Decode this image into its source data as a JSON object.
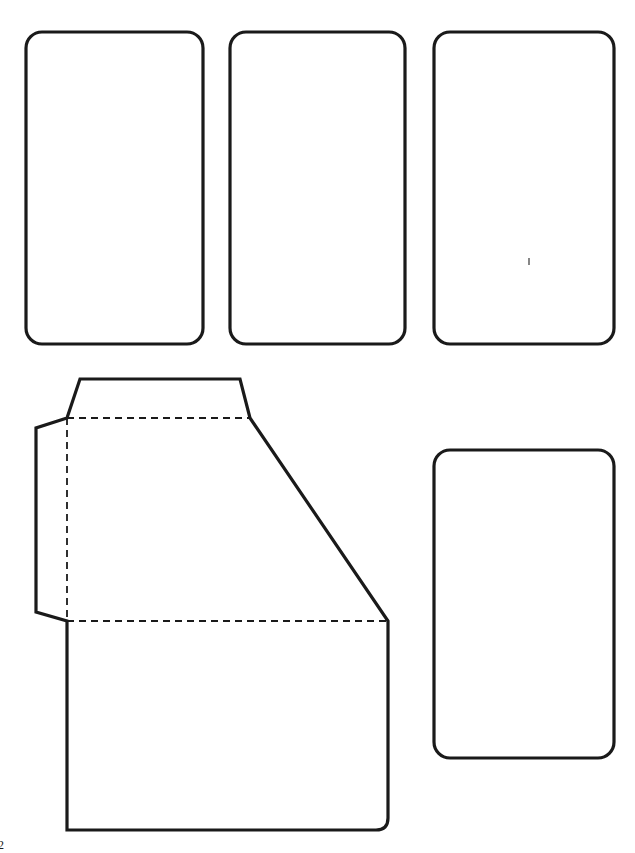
{
  "page": {
    "width": 635,
    "height": 853,
    "background_color": "#ffffff",
    "stroke_color": "#1a1a1a",
    "page_number": "2"
  },
  "style": {
    "solid_stroke_width": 3.2,
    "dashed_stroke_width": 1.8,
    "dash_pattern": "7 5"
  },
  "shapes": [
    {
      "name": "rounded-rect-top-left",
      "kind": "rounded-rectangle",
      "x": 26,
      "y": 32,
      "width": 177,
      "height": 312,
      "corner_radius": 16,
      "line_style": "solid"
    },
    {
      "name": "rounded-rect-top-middle",
      "kind": "rounded-rectangle",
      "x": 230,
      "y": 32,
      "width": 175,
      "height": 312,
      "corner_radius": 16,
      "line_style": "solid"
    },
    {
      "name": "rounded-rect-top-right",
      "kind": "rounded-rectangle",
      "x": 434,
      "y": 32,
      "width": 180,
      "height": 312,
      "corner_radius": 16,
      "line_style": "solid"
    },
    {
      "name": "rounded-rect-bottom-right",
      "kind": "rounded-rectangle",
      "x": 434,
      "y": 450,
      "width": 180,
      "height": 308,
      "corner_radius": 16,
      "line_style": "solid"
    },
    {
      "name": "angled-panel-outline",
      "kind": "polygon-path",
      "line_style": "solid",
      "path": "M 80 379 L 240 379 L 250 418 L 388 621 L 388 818 Q 388 830 376 830 L 67 830 L 67 621 L 36 612 L 36 428 L 67 418 Z",
      "description": "large folded panel with top flap, left side tab, diagonal bevel and rounded bottom-right corner"
    }
  ],
  "fold_lines": [
    {
      "name": "fold-line-top-horizontal",
      "kind": "dashed-line",
      "x1": 67,
      "y1": 418,
      "x2": 250,
      "y2": 418
    },
    {
      "name": "fold-line-vertical",
      "kind": "dashed-line",
      "x1": 67,
      "y1": 418,
      "x2": 67,
      "y2": 621
    },
    {
      "name": "fold-line-bottom-horizontal",
      "kind": "dashed-line",
      "x1": 67,
      "y1": 621,
      "x2": 388,
      "y2": 621
    }
  ],
  "marks": [
    {
      "name": "registration-tick-mark",
      "kind": "tick",
      "x": 529,
      "y": 258,
      "length": 7
    }
  ]
}
